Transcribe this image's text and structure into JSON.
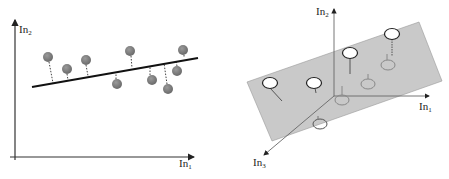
{
  "left_panel": {
    "description": "2D linear regression: points with vertical residuals to fitted line",
    "axis_y_label": "In",
    "axis_y_sub": "2",
    "axis_x_label": "In",
    "axis_x_sub": "1",
    "line": {
      "x1": 32,
      "y1": 87,
      "x2": 198,
      "y2": 58
    },
    "points": [
      {
        "cx": 48,
        "cy": 57
      },
      {
        "cx": 67,
        "cy": 69
      },
      {
        "cx": 86,
        "cy": 60
      },
      {
        "cx": 130,
        "cy": 51
      },
      {
        "cx": 117,
        "cy": 84
      },
      {
        "cx": 152,
        "cy": 80
      },
      {
        "cx": 168,
        "cy": 89
      },
      {
        "cx": 177,
        "cy": 71
      },
      {
        "cx": 183,
        "cy": 50
      }
    ],
    "point_color": "#7a7a7a"
  },
  "right_panel": {
    "description": "3D regression: points relative to fitted plane",
    "axis_y_label": "In",
    "axis_y_sub": "2",
    "axis_x_label": "In",
    "axis_x_sub": "1",
    "axis_z_label": "In",
    "axis_z_sub": "3",
    "plane_color": "#c8c8c8",
    "points_above": [
      {
        "cx": 270,
        "cy": 83,
        "stem_to": [
          283,
          101
        ]
      },
      {
        "cx": 314,
        "cy": 83,
        "stem_to": [
          316,
          94
        ]
      },
      {
        "cx": 350,
        "cy": 53,
        "stem_to": [
          350,
          74
        ]
      },
      {
        "cx": 392,
        "cy": 34,
        "stem_to": [
          392,
          56
        ]
      }
    ],
    "points_below": [
      {
        "cx": 342,
        "cy": 100
      },
      {
        "cx": 368,
        "cy": 84
      },
      {
        "cx": 388,
        "cy": 65
      },
      {
        "cx": 320,
        "cy": 124
      }
    ]
  }
}
